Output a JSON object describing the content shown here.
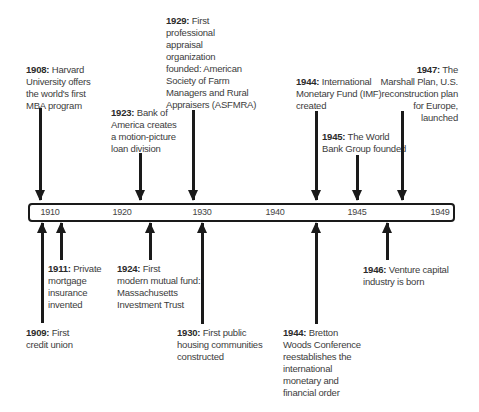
{
  "timeline": {
    "ticks": [
      "1910",
      "1920",
      "1930",
      "1940",
      "1945",
      "1949"
    ],
    "events_above": [
      {
        "year": "1908:",
        "text": [
          "Harvard",
          "University offers",
          "the world's first",
          "MBA program"
        ]
      },
      {
        "year": "1923:",
        "text": [
          "Bank of",
          "America creates",
          "a motion-picture",
          "loan division"
        ]
      },
      {
        "year": "1929:",
        "text": [
          "First",
          "professional",
          "appraisal",
          "organization",
          "founded: American",
          "Society of Farm",
          "Managers and Rural",
          "Appraisers (ASFMRA)"
        ]
      },
      {
        "year": "1944:",
        "text": [
          "International",
          "Monetary Fund (IMF)",
          "created"
        ]
      },
      {
        "year": "1945:",
        "text": [
          "The World",
          "Bank Group founded"
        ]
      },
      {
        "year": "1947:",
        "text": [
          "The",
          "Marshall Plan, U.S.",
          "reconstruction plan",
          "for Europe, launched"
        ]
      }
    ],
    "events_below": [
      {
        "year": "1909:",
        "text": [
          "First",
          "credit union"
        ]
      },
      {
        "year": "1911:",
        "text": [
          "Private",
          "mortgage",
          "insurance",
          "invented"
        ]
      },
      {
        "year": "1924:",
        "text": [
          "First",
          "modern mutual fund:",
          "Massachusetts",
          "Investment Trust"
        ]
      },
      {
        "year": "1930:",
        "text": [
          "First public",
          "housing communities",
          "constructed"
        ]
      },
      {
        "year": "1944:",
        "text": [
          "Bretton",
          "Woods Conference",
          "reestablishes the",
          "international",
          "monetary and",
          "financial order"
        ]
      },
      {
        "year": "1946:",
        "text": [
          "Venture capital",
          "industry is born"
        ]
      }
    ]
  }
}
